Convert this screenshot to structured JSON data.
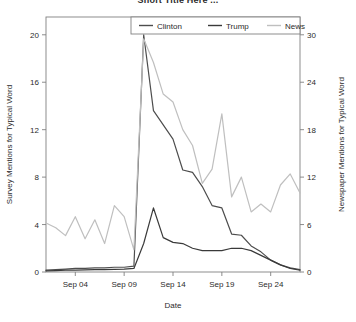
{
  "chart_data": {
    "type": "line",
    "title": "Short Title Here ...",
    "xlabel": "Date",
    "ylabel": "Survey Mentions for Typical Word",
    "ylabel_right": "Newspaper Mentions for Typical Word",
    "grid": false,
    "legend_position": "top-center",
    "xlim": [
      "Sep 01",
      "Sep 27"
    ],
    "ylim": [
      0,
      21.5
    ],
    "ylim_right": [
      0,
      32.25
    ],
    "xticks": [
      "Sep 04",
      "Sep 09",
      "Sep 14",
      "Sep 19",
      "Sep 24"
    ],
    "xtick_days": [
      4,
      9,
      14,
      19,
      24
    ],
    "yticks": [
      0,
      4,
      8,
      12,
      16,
      20
    ],
    "yticks_right": [
      0,
      6,
      12,
      18,
      24,
      30
    ],
    "x": [
      "Sep 01",
      "Sep 02",
      "Sep 03",
      "Sep 04",
      "Sep 05",
      "Sep 06",
      "Sep 07",
      "Sep 08",
      "Sep 09",
      "Sep 10",
      "Sep 11",
      "Sep 12",
      "Sep 13",
      "Sep 14",
      "Sep 15",
      "Sep 16",
      "Sep 17",
      "Sep 18",
      "Sep 19",
      "Sep 20",
      "Sep 21",
      "Sep 22",
      "Sep 23",
      "Sep 24",
      "Sep 25",
      "Sep 26",
      "Sep 27"
    ],
    "series": [
      {
        "name": "Clinton",
        "axis": "left",
        "color": "#4d4d4d",
        "values": [
          0.15,
          0.2,
          0.25,
          0.3,
          0.3,
          0.35,
          0.35,
          0.4,
          0.4,
          0.5,
          20.0,
          13.6,
          12.4,
          11.2,
          8.6,
          8.4,
          7.2,
          5.6,
          5.4,
          3.2,
          3.1,
          2.2,
          1.7,
          1.0,
          0.6,
          0.35,
          0.2
        ]
      },
      {
        "name": "Trump",
        "axis": "left",
        "color": "#3a3a3a",
        "values": [
          0.1,
          0.12,
          0.15,
          0.15,
          0.18,
          0.2,
          0.2,
          0.22,
          0.25,
          0.3,
          2.4,
          5.4,
          2.9,
          2.5,
          2.4,
          2.0,
          1.8,
          1.8,
          1.8,
          2.0,
          2.0,
          1.8,
          1.4,
          1.0,
          0.6,
          0.3,
          0.15
        ]
      },
      {
        "name": "News",
        "axis": "right",
        "color": "#bfbfbf",
        "values": [
          6.2,
          5.6,
          4.6,
          7.0,
          4.2,
          6.6,
          3.6,
          8.4,
          7.0,
          2.8,
          29.5,
          26.5,
          22.5,
          21.5,
          18.0,
          16.0,
          11.2,
          13.0,
          20.0,
          9.5,
          12.0,
          7.6,
          8.6,
          7.6,
          11.0,
          12.4,
          10.0
        ]
      }
    ]
  },
  "legend": {
    "items": [
      {
        "label": "Clinton",
        "color": "#4d4d4d"
      },
      {
        "label": "Trump",
        "color": "#3a3a3a"
      },
      {
        "label": "News",
        "color": "#bfbfbf"
      }
    ]
  },
  "colors": {
    "axis": "#808080",
    "text": "#2b2b2b",
    "clinton": "#4d4d4d",
    "trump": "#3a3a3a",
    "news": "#bfbfbf",
    "background": "#ffffff"
  }
}
